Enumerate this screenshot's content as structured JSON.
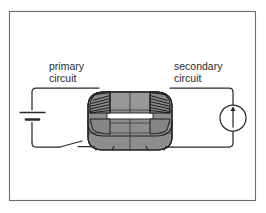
{
  "figure": {
    "name": "transformer-circuit-diagram",
    "background_color": "#ffffff",
    "border_color": "#6b6b6b",
    "ink_color": "#2b2b2b"
  },
  "labels": {
    "primary_line1": "primary",
    "primary_line2": "circuit",
    "secondary_line1": "secondary",
    "secondary_line2": "circuit"
  },
  "core": {
    "name": "transformer-core",
    "fill_top": "#9a9a9a",
    "fill_front": "#8d8d8d",
    "fill_side": "#7e7e7e",
    "outline": "#1f1f1f",
    "gap_color": "#ffffff"
  },
  "windings": {
    "primary": {
      "name": "primary-winding",
      "turns": 7,
      "side": "left"
    },
    "secondary": {
      "name": "secondary-winding",
      "turns": 7,
      "side": "right"
    }
  },
  "components": {
    "battery": {
      "name": "battery-symbol",
      "type": "cell"
    },
    "switch": {
      "name": "switch-symbol",
      "state": "open"
    },
    "meter": {
      "name": "current-source-symbol",
      "type": "circle-with-arrow",
      "arrow_direction": "up"
    }
  }
}
